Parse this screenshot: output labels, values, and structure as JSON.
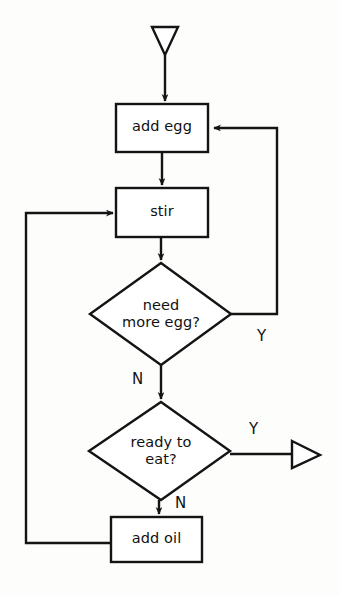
{
  "diagram": {
    "type": "flowchart",
    "stroke_color": "#141414",
    "fill_color": "#ffffff",
    "background_color": "#fdfdfc",
    "nodes": [
      {
        "id": "start",
        "shape": "triangle-down",
        "name": "start-terminator",
        "label": ""
      },
      {
        "id": "add_egg",
        "shape": "rectangle",
        "name": "process-add-egg",
        "label": "add egg"
      },
      {
        "id": "stir",
        "shape": "rectangle",
        "name": "process-stir",
        "label": "stir"
      },
      {
        "id": "need_more_egg",
        "shape": "diamond",
        "name": "decision-need-more-egg",
        "label": "need\nmore egg?"
      },
      {
        "id": "ready_to_eat",
        "shape": "diamond",
        "name": "decision-ready-to-eat",
        "label": "ready to\neat?"
      },
      {
        "id": "add_oil",
        "shape": "rectangle",
        "name": "process-add-oil",
        "label": "add oil"
      },
      {
        "id": "end",
        "shape": "triangle-right",
        "name": "end-terminator",
        "label": ""
      }
    ],
    "edge_labels": {
      "need_more_egg_yes": "Y",
      "need_more_egg_no": "N",
      "ready_to_eat_yes": "Y",
      "ready_to_eat_no": "N"
    },
    "edges": [
      {
        "from": "start",
        "to": "add_egg",
        "label": ""
      },
      {
        "from": "add_egg",
        "to": "stir",
        "label": ""
      },
      {
        "from": "stir",
        "to": "need_more_egg",
        "label": ""
      },
      {
        "from": "need_more_egg",
        "to": "add_egg",
        "label": "Y"
      },
      {
        "from": "need_more_egg",
        "to": "ready_to_eat",
        "label": "N"
      },
      {
        "from": "ready_to_eat",
        "to": "end",
        "label": "Y"
      },
      {
        "from": "ready_to_eat",
        "to": "add_oil",
        "label": "N"
      },
      {
        "from": "add_oil",
        "to": "stir",
        "label": ""
      }
    ]
  }
}
